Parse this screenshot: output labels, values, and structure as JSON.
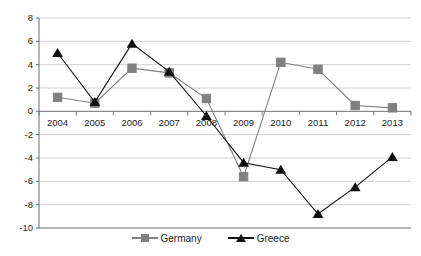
{
  "chart_data": {
    "type": "line",
    "title": "",
    "xlabel": "",
    "ylabel": "",
    "categories": [
      "2004",
      "2005",
      "2006",
      "2007",
      "2008",
      "2009",
      "2010",
      "2011",
      "2012",
      "2013"
    ],
    "x": [
      2004,
      2005,
      2006,
      2007,
      2008,
      2009,
      2010,
      2011,
      2012,
      2013
    ],
    "series": [
      {
        "name": "Germany",
        "color": "#808080",
        "marker": "square",
        "values": [
          1.2,
          0.7,
          3.7,
          3.3,
          1.1,
          -5.6,
          4.2,
          3.6,
          0.5,
          0.3
        ]
      },
      {
        "name": "Greece",
        "color": "#111111",
        "marker": "triangle",
        "values": [
          5.0,
          0.8,
          5.8,
          3.4,
          -0.4,
          -4.4,
          -5.0,
          -8.8,
          -6.5,
          -3.9
        ]
      }
    ],
    "ylim": [
      -10,
      8
    ],
    "yticks": [
      8,
      6,
      4,
      2,
      0,
      -2,
      -4,
      -6,
      -8,
      -10
    ],
    "ytick_labels": [
      "8",
      "6",
      "4",
      "2",
      "0",
      "-2",
      "-4",
      "-6",
      "-8",
      "-10"
    ],
    "xlim": [
      2003.5,
      2013.5
    ],
    "grid": true,
    "grid_axis": "y",
    "grid_color": "#d0d0d0",
    "legend_position": "bottom",
    "legend": [
      "Germany",
      "Greece"
    ],
    "axis_color": "#808080",
    "background": "#ffffff"
  }
}
